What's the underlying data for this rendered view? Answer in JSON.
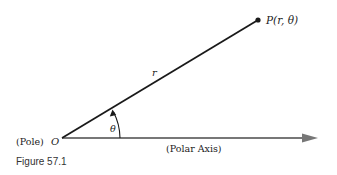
{
  "figure": {
    "caption": "Figure 57.1",
    "pole_label": "(Pole)",
    "origin_label": "O",
    "point_label": "P(r, θ)",
    "radius_label": "r",
    "angle_label": "θ",
    "axis_label": "(Polar Axis)",
    "colors": {
      "ray": "#1a1a1a",
      "axis": "#777777",
      "text": "#222222"
    }
  }
}
